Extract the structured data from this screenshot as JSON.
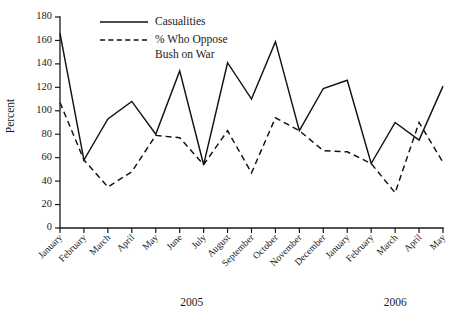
{
  "chart_data": {
    "type": "line",
    "title": "",
    "xlabel": "",
    "ylabel": "Percent",
    "ylim": [
      0,
      180
    ],
    "ytick_step": 20,
    "grid": false,
    "legend_position": "top-center",
    "yticks": [
      "0",
      "20",
      "40",
      "60",
      "80",
      "100",
      "120",
      "140",
      "160",
      "180"
    ],
    "categories": [
      "January",
      "February",
      "March",
      "April",
      "May",
      "June",
      "July",
      "August",
      "September",
      "October",
      "November",
      "December",
      "January",
      "February",
      "March",
      "April",
      "May"
    ],
    "group_labels": [
      {
        "label": "2005",
        "start_index": 0,
        "end_index": 11
      },
      {
        "label": "2006",
        "start_index": 12,
        "end_index": 16
      }
    ],
    "series": [
      {
        "name": "Casualities",
        "style": "solid",
        "values": [
          166,
          58,
          93,
          108,
          80,
          134,
          54,
          141,
          110,
          159,
          83,
          119,
          126,
          55,
          90,
          75,
          121
        ]
      },
      {
        "name": "% Who Oppose Bush on War",
        "style": "dashed",
        "legend_line1": "% Who Oppose",
        "legend_line2": "Bush on War",
        "values": [
          107,
          58,
          35,
          48,
          79,
          77,
          54,
          83,
          47,
          94,
          83,
          66,
          65,
          55,
          30,
          90,
          56
        ]
      }
    ],
    "colors": {
      "series_line": "#111111",
      "axis": "#1a1a1a",
      "background": "#ffffff"
    }
  }
}
